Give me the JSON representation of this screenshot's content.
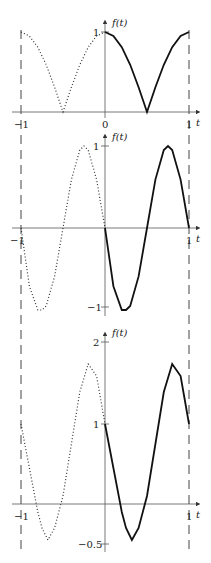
{
  "chart_data": [
    {
      "type": "line",
      "panel": 1,
      "ylabel": "f(t)",
      "xlabel": "t",
      "xticks": [
        "-1",
        "0",
        "1"
      ],
      "yticks": [
        "1"
      ],
      "xlim": [
        -1,
        1
      ],
      "ylim": [
        0,
        1
      ],
      "series": [
        {
          "name": "solid (t in [0,1])",
          "style": "solid",
          "x": [
            0,
            0.1,
            0.2,
            0.3,
            0.4,
            0.5,
            0.6,
            0.7,
            0.8,
            0.9,
            1.0
          ],
          "y": [
            1,
            0.95,
            0.81,
            0.59,
            0.31,
            0,
            0.31,
            0.59,
            0.81,
            0.95,
            1
          ]
        },
        {
          "name": "dotted (t in [-1,0])",
          "style": "dotted",
          "x": [
            -1,
            -0.9,
            -0.8,
            -0.7,
            -0.6,
            -0.5,
            -0.4,
            -0.3,
            -0.2,
            -0.1,
            0
          ],
          "y": [
            1,
            0.95,
            0.81,
            0.59,
            0.31,
            0,
            0.31,
            0.59,
            0.81,
            0.95,
            1
          ]
        }
      ]
    },
    {
      "type": "line",
      "panel": 2,
      "ylabel": "f(t)",
      "xlabel": "t",
      "xticks": [
        "-1",
        "1"
      ],
      "yticks": [
        "1",
        "-1"
      ],
      "xlim": [
        -1,
        1
      ],
      "ylim": [
        -1,
        1
      ],
      "series": [
        {
          "name": "solid (t in [0,1])",
          "style": "solid",
          "x": [
            0,
            0.1,
            0.2,
            0.25,
            0.3,
            0.4,
            0.5,
            0.6,
            0.7,
            0.75,
            0.8,
            0.9,
            1.0
          ],
          "y": [
            0,
            -0.71,
            -1,
            -1,
            -0.95,
            -0.59,
            0,
            0.59,
            0.95,
            1,
            0.95,
            0.59,
            0
          ]
        },
        {
          "name": "dotted (t in [-1,0])",
          "style": "dotted",
          "x": [
            -1,
            -0.9,
            -0.8,
            -0.75,
            -0.7,
            -0.6,
            -0.5,
            -0.4,
            -0.3,
            -0.25,
            -0.2,
            -0.1,
            0
          ],
          "y": [
            0,
            -0.71,
            -1,
            -1,
            -0.95,
            -0.59,
            0,
            0.59,
            0.95,
            1,
            0.95,
            0.59,
            0
          ]
        }
      ]
    },
    {
      "type": "line",
      "panel": 3,
      "ylabel": "f(t)",
      "xlabel": "t",
      "xticks": [
        "-1",
        "1"
      ],
      "yticks": [
        "2",
        "1",
        "-0.5"
      ],
      "xlim": [
        -1,
        1
      ],
      "ylim": [
        -0.5,
        2
      ],
      "series": [
        {
          "name": "solid (t in [0,1])",
          "style": "solid",
          "x": [
            0,
            0.1,
            0.2,
            0.25,
            0.32,
            0.4,
            0.5,
            0.6,
            0.7,
            0.8,
            0.9,
            0.95,
            1.0
          ],
          "y": [
            1,
            0.45,
            -0.1,
            -0.3,
            -0.45,
            -0.3,
            0.1,
            0.75,
            1.4,
            1.75,
            1.6,
            1.3,
            1
          ]
        },
        {
          "name": "dotted (t in [-1,0])",
          "style": "dotted",
          "x": [
            -1,
            -0.9,
            -0.8,
            -0.75,
            -0.68,
            -0.6,
            -0.5,
            -0.4,
            -0.3,
            -0.2,
            -0.1,
            -0.05,
            0
          ],
          "y": [
            1,
            0.45,
            -0.1,
            -0.3,
            -0.45,
            -0.3,
            0.1,
            0.75,
            1.4,
            1.75,
            1.6,
            1.3,
            1
          ]
        }
      ]
    }
  ],
  "labels": {
    "ylabel": "f(t)",
    "xlabel": "t",
    "p1": {
      "x_neg1": "−1",
      "x_0": "0",
      "x_1": "1",
      "y_1": "1"
    },
    "p2": {
      "x_neg1": "−1",
      "x_1": "1",
      "y_1": "1",
      "y_neg1": "−1"
    },
    "p3": {
      "x_neg1": "−1",
      "x_1": "1",
      "y_2": "2",
      "y_1": "1",
      "y_neg05": "−0.5"
    }
  }
}
